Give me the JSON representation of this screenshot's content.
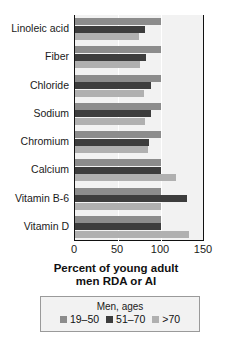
{
  "chart_data": {
    "type": "bar",
    "orientation": "horizontal",
    "title": "",
    "subtitle": "",
    "xlabel": "Percent of young adult\nmen RDA or AI",
    "xlabel_line1": "Percent of young adult",
    "xlabel_line2": "men RDA or AI",
    "ylabel": "",
    "xlim": [
      0,
      150
    ],
    "xticks": [
      0,
      50,
      100,
      150
    ],
    "xtick_labels": [
      "0",
      "50",
      "100",
      "150"
    ],
    "grid": true,
    "grid_axis": "x",
    "legend_position": "below-axis",
    "legend_title": "Men, ages",
    "categories": [
      "Linoleic acid",
      "Fiber",
      "Chloride",
      "Sodium",
      "Chromium",
      "Calcium",
      "Vitamin B-6",
      "Vitamin D"
    ],
    "series": [
      {
        "name": "19–50",
        "color": "#8c8c8c",
        "values": [
          100,
          100,
          100,
          100,
          100,
          100,
          100,
          100
        ]
      },
      {
        "name": "51–70",
        "color": "#3d3d3d",
        "values": [
          81,
          83,
          88,
          88,
          86,
          100,
          130,
          100
        ]
      },
      {
        "name": ">70",
        "color": "#b0b0b0",
        "values": [
          74,
          75,
          80,
          81,
          85,
          118,
          100,
          133
        ]
      }
    ]
  },
  "legend": {
    "title": "Men, ages",
    "items": [
      {
        "label": "19–50",
        "color": "#8c8c8c"
      },
      {
        "label": "51–70",
        "color": "#3d3d3d"
      },
      {
        "label": ">70",
        "color": "#b0b0b0"
      }
    ]
  },
  "axis": {
    "x_label_line1": "Percent of young adult",
    "x_label_line2": "men RDA or AI",
    "ticks": [
      "0",
      "50",
      "100",
      "150"
    ]
  },
  "colors": {
    "plot_background": "#f2f2f2",
    "axis_line": "#111111",
    "gridline": "#ffffff",
    "series_19_50": "#8c8c8c",
    "series_51_70": "#3d3d3d",
    "series_over_70": "#b0b0b0"
  }
}
